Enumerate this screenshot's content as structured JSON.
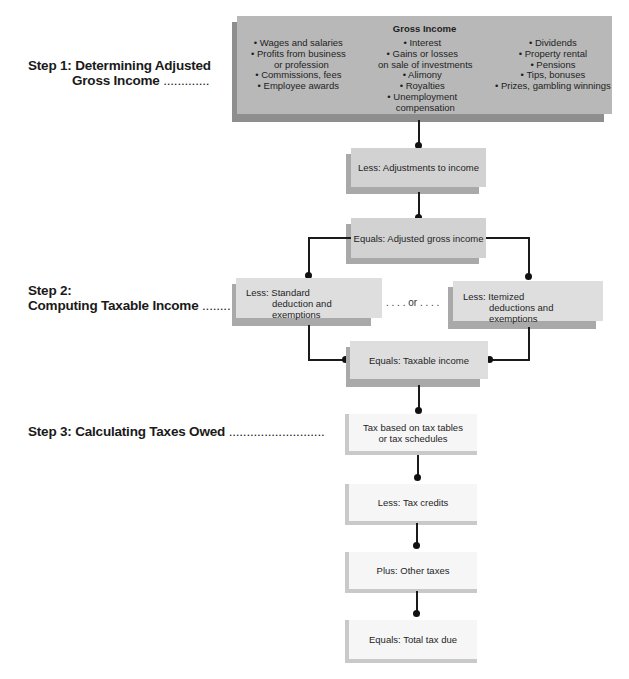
{
  "steps": [
    {
      "line1": "Step 1: Determining Adjusted",
      "line2": "Gross Income",
      "leader": "............."
    },
    {
      "line1": "Step 2:",
      "line2": "Computing Taxable Income",
      "leader": "........"
    },
    {
      "line1": "Step 3: Calculating Taxes Owed",
      "leader": "..........................."
    }
  ],
  "gross_income": {
    "title": "Gross Income",
    "columns": [
      [
        "• Wages and salaries",
        "• Profits from business",
        "   or profession",
        "• Commissions, fees",
        "• Employee awards"
      ],
      [
        "• Interest",
        "• Gains or losses",
        "   on sale of investments",
        "• Alimony",
        "• Royalties",
        "• Unemployment",
        "   compensation"
      ],
      [
        "• Dividends",
        "• Property rental",
        "• Pensions",
        "• Tips, bonuses",
        "• Prizes, gambling winnings"
      ]
    ]
  },
  "boxes": {
    "adjustments": "Less: Adjustments to income",
    "agi": "Equals: Adjusted gross income",
    "standard_l1": "Less: Standard",
    "standard_l2": "deduction and exemptions",
    "or_text": ". . . . or . . . .",
    "itemized_l1": "Less: Itemized",
    "itemized_l2": "deductions and exemptions",
    "taxable": "Equals: Taxable income",
    "tax_based_l1": "Tax based on tax tables",
    "tax_based_l2": "or tax schedules",
    "credits": "Less: Tax credits",
    "other": "Plus: Other taxes",
    "total": "Equals: Total tax due"
  },
  "colors": {
    "dark_box": "#b8b8b8",
    "mid_box": "#d2d2d2",
    "light_box": "#f6f6f6",
    "line": "#1a1a1a"
  }
}
